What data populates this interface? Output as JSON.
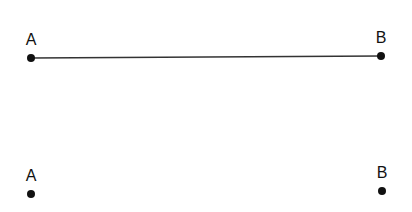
{
  "diagram": {
    "segment": {
      "start": {
        "label": "A",
        "x": 31,
        "y": 58
      },
      "end": {
        "label": "B",
        "x": 381,
        "y": 56
      },
      "line_color": "#333333"
    },
    "points": [
      {
        "label": "A",
        "x": 31,
        "y": 194
      },
      {
        "label": "B",
        "x": 382,
        "y": 191
      }
    ],
    "point_color": "#111111"
  }
}
